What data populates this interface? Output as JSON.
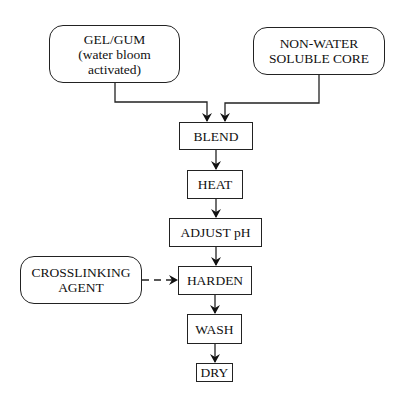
{
  "diagram": {
    "type": "flowchart",
    "inputs": {
      "gel_gum": {
        "lines": [
          "GEL/GUM",
          "(water bloom",
          "activated)"
        ]
      },
      "core": {
        "lines": [
          "NON-WATER",
          "SOLUBLE CORE"
        ]
      },
      "crosslinker": {
        "lines": [
          "CROSSLINKING",
          "AGENT"
        ]
      }
    },
    "steps": [
      {
        "id": "blend",
        "label": "BLEND"
      },
      {
        "id": "heat",
        "label": "HEAT"
      },
      {
        "id": "adjust_ph",
        "label": "ADJUST pH"
      },
      {
        "id": "harden",
        "label": "HARDEN"
      },
      {
        "id": "wash",
        "label": "WASH"
      },
      {
        "id": "dry",
        "label": "DRY"
      }
    ],
    "edges": [
      {
        "from": "GEL/GUM",
        "to": "BLEND",
        "style": "solid"
      },
      {
        "from": "NON-WATER SOLUBLE CORE",
        "to": "BLEND",
        "style": "solid"
      },
      {
        "from": "BLEND",
        "to": "HEAT",
        "style": "solid"
      },
      {
        "from": "HEAT",
        "to": "ADJUST pH",
        "style": "solid"
      },
      {
        "from": "ADJUST pH",
        "to": "HARDEN",
        "style": "solid"
      },
      {
        "from": "CROSSLINKING AGENT",
        "to": "HARDEN",
        "style": "dashed"
      },
      {
        "from": "HARDEN",
        "to": "WASH",
        "style": "solid"
      },
      {
        "from": "WASH",
        "to": "DRY",
        "style": "solid"
      }
    ]
  }
}
